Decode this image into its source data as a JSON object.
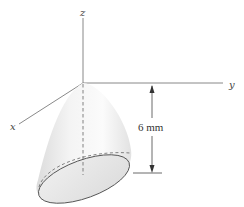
{
  "diagram": {
    "type": "3d-solid-with-axes",
    "shape": "paraboloid",
    "axes": {
      "z_label": "z",
      "y_label": "y",
      "x_label": "x"
    },
    "dimension": {
      "label": "6 mm",
      "value": 6,
      "unit": "mm"
    },
    "colors": {
      "axis": "#6b6b6b",
      "outline": "#555555",
      "surface_light": "#fafafa",
      "surface_shade": "#dedede",
      "base_fill": "#e6e6e6"
    }
  }
}
